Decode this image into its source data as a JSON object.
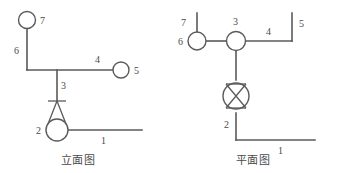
{
  "figure": {
    "title": "",
    "background_color": "#ffffff",
    "line_color": "#5a5a5a",
    "text_color": "#4a4a4a",
    "width": 339,
    "height": 173
  },
  "elevation_view": {
    "caption": "立面图",
    "labels": {
      "n1": "1",
      "n2": "2",
      "n3": "3",
      "n4": "4",
      "n5": "5",
      "n6": "6",
      "n7": "7"
    },
    "components": {
      "riser_head_circle": "circle-7",
      "branch_end_circle": "circle-5",
      "pendent_sprinkler": "sprinkler-elevation",
      "sprinkler_body_circle": "circle-2"
    }
  },
  "plan_view": {
    "caption": "平面图",
    "labels": {
      "n1": "1",
      "n2": "2",
      "n3": "3",
      "n4": "4",
      "n5": "5",
      "n6": "6",
      "n7": "7"
    },
    "components": {
      "end_circle_left": "circle-6",
      "tee_circle": "circle-3",
      "sprinkler_plan": "sprinkler-plan"
    }
  }
}
